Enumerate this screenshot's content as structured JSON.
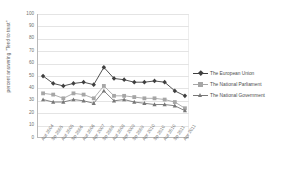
{
  "chart_data": {
    "type": "line",
    "title": "",
    "xlabel": "",
    "ylabel": "percent answering \"Tend to trust\"",
    "ylim": [
      0,
      100
    ],
    "ytick_step": 10,
    "grid": true,
    "legend_position": "right",
    "yticks": [
      "100",
      "90",
      "80",
      "70",
      "60",
      "50",
      "40",
      "30",
      "20",
      "10",
      "0"
    ],
    "categories": [
      "Aut 2004",
      "Sp 2005",
      "Aut 2005",
      "Sp 2006",
      "Aut 2006",
      "Apr 2007",
      "Sp 2008",
      "Aut 2008",
      "Apr 2009",
      "Sp 2009",
      "Apr 2010",
      "Sp 2010",
      "Aut 2010",
      "Sp 2011",
      "Apr 2011"
    ],
    "series": [
      {
        "name": "The European Union",
        "color": "#3f3f3f",
        "marker": "diamond",
        "values": [
          50,
          44,
          42,
          44,
          45,
          43,
          57,
          48,
          47,
          45,
          45,
          46,
          45,
          38,
          34
        ]
      },
      {
        "name": "The National Parliament",
        "color": "#a6a6a6",
        "marker": "square",
        "values": [
          36,
          35,
          32,
          36,
          35,
          32,
          42,
          34,
          34,
          33,
          32,
          32,
          31,
          29,
          24
        ]
      },
      {
        "name": "The National Government",
        "color": "#777777",
        "marker": "triangle",
        "values": [
          31,
          29,
          29,
          31,
          30,
          28,
          38,
          30,
          31,
          29,
          28,
          27,
          27,
          26,
          22
        ]
      }
    ]
  },
  "legend": {
    "items": [
      {
        "label": "The European Union"
      },
      {
        "label": "The National Parliament"
      },
      {
        "label": "The National Government"
      }
    ]
  }
}
